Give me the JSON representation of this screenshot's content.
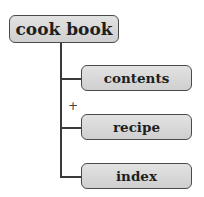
{
  "diagram": {
    "type": "tree",
    "root": {
      "label": "cook book"
    },
    "children": [
      {
        "label": "contents"
      },
      {
        "label": "recipe"
      },
      {
        "label": "index"
      }
    ],
    "expand_marker": "+",
    "colors": {
      "box_fill": "#d8d8d8",
      "box_border": "#4a4a4a",
      "line": "#3a3a3a",
      "text": "#1e1e1e"
    }
  }
}
